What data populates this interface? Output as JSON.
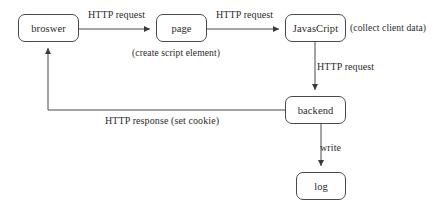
{
  "diagram": {
    "type": "flowchart",
    "title": "",
    "nodes": [
      {
        "id": "browser",
        "label": "broswer",
        "x": 18,
        "y": 14,
        "w": 61,
        "h": 28
      },
      {
        "id": "page",
        "label": "page",
        "x": 156,
        "y": 14,
        "w": 51,
        "h": 28
      },
      {
        "id": "javascript",
        "label": "JavasCript",
        "x": 285,
        "y": 14,
        "w": 61,
        "h": 28
      },
      {
        "id": "backend",
        "label": "backend",
        "x": 285,
        "y": 96,
        "w": 61,
        "h": 28
      },
      {
        "id": "log",
        "label": "log",
        "x": 296,
        "y": 172,
        "w": 50,
        "h": 28
      }
    ],
    "edges": [
      {
        "id": "browser-to-page",
        "label": "HTTP request",
        "label_x": 88,
        "label_y": 9
      },
      {
        "id": "page-to-javascript",
        "label": "HTTP request",
        "label_x": 216,
        "label_y": 9
      },
      {
        "id": "javascript-to-backend",
        "label": "HTTP request",
        "label_x": 317,
        "label_y": 61
      },
      {
        "id": "backend-to-browser",
        "label": "HTTP response (set cookie)",
        "label_x": 105,
        "label_y": 115
      },
      {
        "id": "backend-to-log",
        "label": "write",
        "label_x": 320,
        "label_y": 142
      }
    ],
    "annotations": [
      {
        "id": "page-note",
        "label": "(create script element)",
        "x": 132,
        "y": 47
      },
      {
        "id": "javascript-note",
        "label": "(collect client data)",
        "x": 350,
        "y": 22
      }
    ],
    "colors": {
      "stroke": "#4a4a4a",
      "text": "#2b2b2b",
      "background": "#ffffff"
    }
  }
}
